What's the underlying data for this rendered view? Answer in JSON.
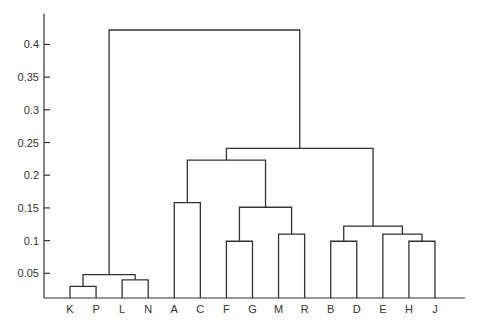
{
  "chart_data": {
    "type": "dendrogram",
    "title": "",
    "xlabel": "",
    "ylabel": "",
    "ylim": [
      0.012,
      0.44
    ],
    "grid": false,
    "legend": null,
    "y_ticks": [
      0.05,
      0.1,
      0.15,
      0.2,
      0.25,
      0.3,
      0.35,
      0.4
    ],
    "y_tick_labels": [
      "0.05",
      "0.1",
      "0.15",
      "0.2",
      "0.25",
      "0.3",
      "0.35",
      "0.4"
    ],
    "leaves": [
      "K",
      "P",
      "L",
      "N",
      "A",
      "C",
      "F",
      "G",
      "M",
      "R",
      "B",
      "D",
      "E",
      "H",
      "J"
    ],
    "merges": [
      {
        "left": "K",
        "right": "P",
        "height": 0.03
      },
      {
        "left": "L",
        "right": "N",
        "height": 0.04
      },
      {
        "left": "KP",
        "right": "LN",
        "height": 0.048
      },
      {
        "left": "A",
        "right": "C",
        "height": 0.158
      },
      {
        "left": "F",
        "right": "G",
        "height": 0.099
      },
      {
        "left": "M",
        "right": "R",
        "height": 0.11
      },
      {
        "left": "FG",
        "right": "MR",
        "height": 0.151
      },
      {
        "left": "AC",
        "right": "FGMR",
        "height": 0.223
      },
      {
        "left": "B",
        "right": "D",
        "height": 0.099
      },
      {
        "left": "H",
        "right": "J",
        "height": 0.099
      },
      {
        "left": "E",
        "right": "HJ",
        "height": 0.11
      },
      {
        "left": "BD",
        "right": "EHJ",
        "height": 0.122
      },
      {
        "left": "ACFGMR",
        "right": "BDEHJ",
        "height": 0.241
      },
      {
        "left": "KPLN",
        "right": "ACFGMRBDEHJ",
        "height": 0.422
      }
    ]
  },
  "colors": {
    "line": "#333333",
    "background": "#ffffff"
  }
}
